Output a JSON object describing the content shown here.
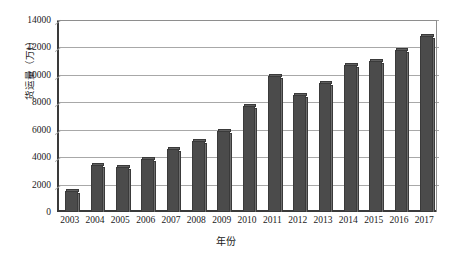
{
  "chart_data": {
    "type": "bar",
    "title": "",
    "subtitle": "",
    "xlabel": "年份",
    "ylabel": "货运量（万t）",
    "categories": [
      "2003",
      "2004",
      "2005",
      "2006",
      "2007",
      "2008",
      "2009",
      "2010",
      "2011",
      "2012",
      "2013",
      "2014",
      "2015",
      "2016",
      "2017"
    ],
    "values": [
      1550,
      3400,
      3300,
      3900,
      4600,
      5200,
      5900,
      7700,
      9900,
      8500,
      9400,
      10700,
      11000,
      11800,
      12800
    ],
    "series": [
      {
        "name": "货运量",
        "values": [
          1550,
          3400,
          3300,
          3900,
          4600,
          5200,
          5900,
          7700,
          9900,
          8500,
          9400,
          10700,
          11000,
          11800,
          12800
        ]
      }
    ],
    "ylim": [
      0,
      14000
    ],
    "ytick_values": [
      0,
      2000,
      4000,
      6000,
      8000,
      10000,
      12000,
      14000
    ],
    "ytick_labels": [
      "0",
      "2000",
      "4000",
      "6000",
      "8000",
      "10000",
      "12000",
      "14000"
    ],
    "grid": "horizontal",
    "legend": "none",
    "bar_color": "#4b4b4b",
    "bar_edge_color": "#3a3a3a",
    "grid_color": "#a8a8a8",
    "axis_color": "#3a3a3a",
    "background": "#ffffff",
    "annotations": []
  }
}
